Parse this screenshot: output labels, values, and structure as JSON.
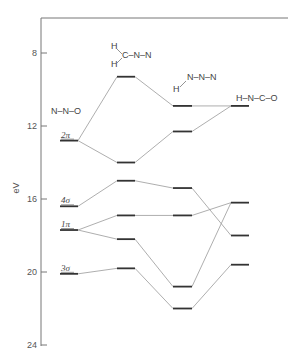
{
  "axis": {
    "label": "eV",
    "ticks": [
      {
        "value": 8,
        "label": "8"
      },
      {
        "value": 12,
        "label": "12"
      },
      {
        "value": 16,
        "label": "16"
      },
      {
        "value": 20,
        "label": "20"
      },
      {
        "value": 24,
        "label": "24"
      }
    ],
    "range": [
      6,
      24
    ]
  },
  "molecules": [
    {
      "id": "n2o",
      "label": "N–N–O",
      "x1": 60,
      "x2": 78,
      "levels": [
        {
          "ev": 12.8,
          "label": "2π"
        },
        {
          "ev": 16.4,
          "label": "4σ"
        },
        {
          "ev": 17.7,
          "label": "1π"
        },
        {
          "ev": 20.1,
          "label": "3σ"
        }
      ]
    },
    {
      "id": "h2cnn",
      "label_parts": [
        "H",
        "C–N–N",
        "H"
      ],
      "x1": 117,
      "x2": 135,
      "levels": [
        {
          "ev": 9.3
        },
        {
          "ev": 14.0
        },
        {
          "ev": 15.0
        },
        {
          "ev": 16.9
        },
        {
          "ev": 18.2
        },
        {
          "ev": 19.8
        }
      ]
    },
    {
      "id": "hn3",
      "label_parts": [
        "N–N–N",
        "H"
      ],
      "x1": 173,
      "x2": 192,
      "levels": [
        {
          "ev": 10.9
        },
        {
          "ev": 12.3
        },
        {
          "ev": 15.4
        },
        {
          "ev": 16.9
        },
        {
          "ev": 20.8
        },
        {
          "ev": 22.0
        }
      ]
    },
    {
      "id": "hnco",
      "label": "H–N–C–O",
      "x1": 231,
      "x2": 249,
      "levels": [
        {
          "ev": 10.9
        },
        {
          "ev": 16.2
        },
        {
          "ev": 18.0
        },
        {
          "ev": 19.6
        }
      ]
    }
  ],
  "connections": [
    {
      "from": [
        "n2o",
        0
      ],
      "to": [
        "h2cnn",
        0
      ]
    },
    {
      "from": [
        "n2o",
        0
      ],
      "to": [
        "h2cnn",
        1
      ]
    },
    {
      "from": [
        "n2o",
        1
      ],
      "to": [
        "h2cnn",
        2
      ]
    },
    {
      "from": [
        "n2o",
        2
      ],
      "to": [
        "h2cnn",
        3
      ]
    },
    {
      "from": [
        "n2o",
        2
      ],
      "to": [
        "h2cnn",
        4
      ]
    },
    {
      "from": [
        "n2o",
        3
      ],
      "to": [
        "h2cnn",
        5
      ]
    },
    {
      "from": [
        "h2cnn",
        0
      ],
      "to": [
        "hn3",
        0
      ]
    },
    {
      "from": [
        "h2cnn",
        1
      ],
      "to": [
        "hn3",
        1
      ]
    },
    {
      "from": [
        "h2cnn",
        2
      ],
      "to": [
        "hn3",
        2
      ]
    },
    {
      "from": [
        "h2cnn",
        3
      ],
      "to": [
        "hn3",
        3
      ]
    },
    {
      "from": [
        "h2cnn",
        4
      ],
      "to": [
        "hn3",
        4
      ]
    },
    {
      "from": [
        "h2cnn",
        5
      ],
      "to": [
        "hn3",
        5
      ]
    },
    {
      "from": [
        "hn3",
        0
      ],
      "to": [
        "hnco",
        0
      ]
    },
    {
      "from": [
        "hn3",
        1
      ],
      "to": [
        "hnco",
        0
      ]
    },
    {
      "from": [
        "hn3",
        2
      ],
      "to": [
        "hnco",
        2
      ]
    },
    {
      "from": [
        "hn3",
        3
      ],
      "to": [
        "hnco",
        1
      ]
    },
    {
      "from": [
        "hn3",
        4
      ],
      "to": [
        "hnco",
        1
      ]
    },
    {
      "from": [
        "hn3",
        5
      ],
      "to": [
        "hnco",
        3
      ]
    }
  ]
}
